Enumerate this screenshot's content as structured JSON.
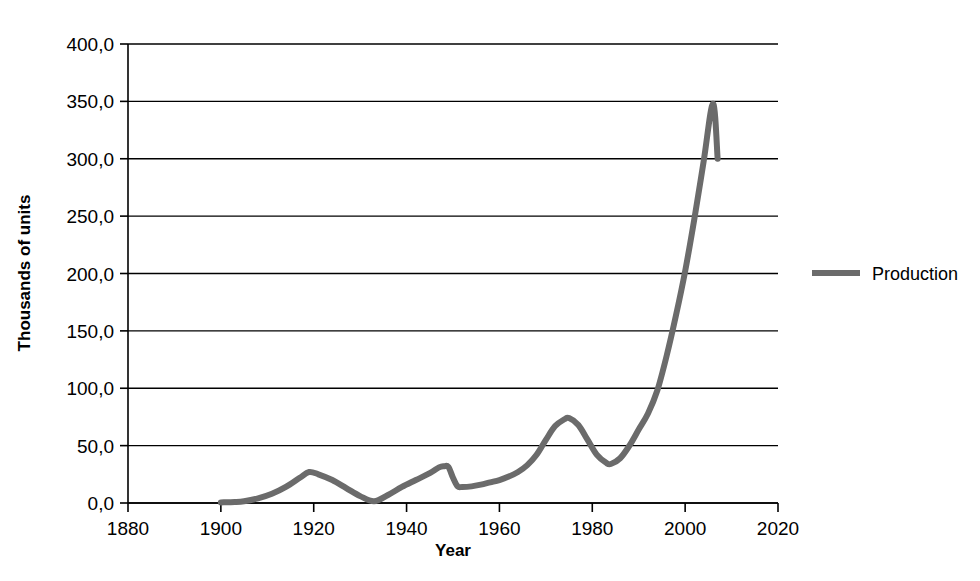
{
  "chart_data": {
    "type": "line",
    "title": "",
    "xlabel": "Year",
    "ylabel": "Thousands of units",
    "xlim": [
      1880,
      2020
    ],
    "ylim": [
      0,
      400
    ],
    "xticks": [
      1880,
      1900,
      1920,
      1940,
      1960,
      1980,
      2000,
      2020
    ],
    "xtick_labels": [
      "1880",
      "1900",
      "1920",
      "1940",
      "1960",
      "1980",
      "2000",
      "2020"
    ],
    "yticks": [
      0,
      50,
      100,
      150,
      200,
      250,
      300,
      350,
      400
    ],
    "ytick_labels": [
      "0,0",
      "50,0",
      "100,0",
      "150,0",
      "200,0",
      "250,0",
      "300,0",
      "350,0",
      "400,0"
    ],
    "grid": "horizontal",
    "legend_position": "right",
    "series": [
      {
        "name": "Production",
        "color": "#6b6b6b",
        "line_width": 6,
        "x": [
          1900,
          1903,
          1905,
          1908,
          1911,
          1914,
          1917,
          1919,
          1921,
          1924,
          1927,
          1930,
          1933,
          1936,
          1939,
          1942,
          1945,
          1947,
          1948,
          1949,
          1950,
          1951,
          1952,
          1954,
          1956,
          1958,
          1960,
          1962,
          1964,
          1966,
          1968,
          1970,
          1972,
          1974,
          1975,
          1977,
          1979,
          1981,
          1983,
          1984,
          1986,
          1988,
          1990,
          1992,
          1994,
          1996,
          1998,
          2000,
          2002,
          2004,
          2006,
          2007
        ],
        "y": [
          0.5,
          0.8,
          1.5,
          4.0,
          8.0,
          14.0,
          22.0,
          27.0,
          25.0,
          20.0,
          13.0,
          6.0,
          1.5,
          7.0,
          14.0,
          20.0,
          26.0,
          31.0,
          32.0,
          31.5,
          22.0,
          14.5,
          14.0,
          14.5,
          16.0,
          18.0,
          20.0,
          23.0,
          27.0,
          33.0,
          42.0,
          55.0,
          67.0,
          73.0,
          74.0,
          68.0,
          55.0,
          42.0,
          35.0,
          34.0,
          39.0,
          50.0,
          64.0,
          78.0,
          98.0,
          128.0,
          163.0,
          202.0,
          248.0,
          298.0,
          348.0,
          300.0
        ]
      }
    ]
  },
  "legend": {
    "entries": [
      {
        "label": "Production",
        "color": "#6b6b6b"
      }
    ]
  },
  "axes": {
    "x_title": "Year",
    "y_title": "Thousands of units"
  }
}
